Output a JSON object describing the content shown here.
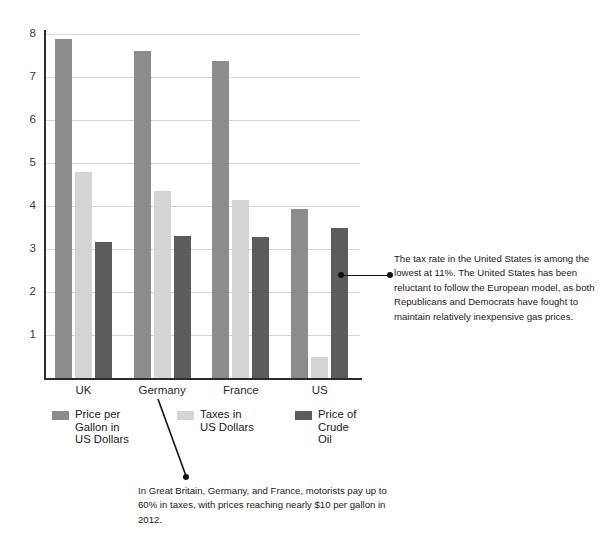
{
  "chart_data": {
    "type": "bar",
    "title": "",
    "xlabel": "",
    "ylabel": "",
    "ylim": [
      0,
      8.4
    ],
    "grid": true,
    "legend_position": "below-plot",
    "categories": [
      "UK",
      "Germany",
      "France",
      "US"
    ],
    "yticks": [
      "1",
      "2",
      "3",
      "4",
      "5",
      "6",
      "7",
      "8"
    ],
    "series": [
      {
        "name": "Price per Gallon in US Dollars",
        "legend_label": "Price per\nGallon in\nUS Dollars",
        "color": "#8c8c8c",
        "values": [
          7.88,
          7.6,
          7.37,
          3.92
        ]
      },
      {
        "name": "Taxes in US Dollars",
        "legend_label": "Taxes in\nUS Dollars",
        "color": "#d4d4d4",
        "values": [
          4.78,
          4.35,
          4.15,
          0.5
        ]
      },
      {
        "name": "Price of Crude Oil",
        "legend_label": "Price of\nCrude Oil",
        "color": "#5c5c5c",
        "values": [
          3.17,
          3.3,
          3.28,
          3.5
        ]
      }
    ],
    "annotations": [
      {
        "id": "us-tax-rate",
        "text": "The tax rate in the United States is among the lowest at 11%. The United States has been reluctant to follow the European model, as both Republicans and Democrats have fought to maintain relatively inexpensive gas prices.",
        "target": "US"
      },
      {
        "id": "europe-taxes",
        "text": "In Great Britain, Germany, and France, motorists pay up to 60% in taxes, with prices reaching nearly $10 per gallon in 2012.",
        "target": "Germany"
      }
    ]
  },
  "axis": {
    "ticks": [
      "8",
      "7",
      "6",
      "5",
      "4",
      "3",
      "2",
      "1"
    ]
  },
  "categories": {
    "uk": "UK",
    "germany": "Germany",
    "france": "France",
    "us": "US"
  },
  "legend": {
    "item1": "Price per\nGallon in\nUS Dollars",
    "item2": "Taxes in\nUS Dollars",
    "item3": "Price of\nCrude Oil"
  },
  "annotations": {
    "right": "The tax rate in the United States is among the lowest at 11%. The United States has been reluctant to follow the European model, as both Republicans and Democrats have fought to maintain relatively inexpensive gas prices.",
    "bottom": "In Great Britain, Germany, and France, motorists pay up to 60% in taxes, with prices reaching nearly $10 per gallon in 2012."
  },
  "colors": {
    "series1": "#8c8c8c",
    "series2": "#d4d4d4",
    "series3": "#5c5c5c",
    "axis": "#2b2b2b",
    "grid": "#d6d6d6"
  }
}
